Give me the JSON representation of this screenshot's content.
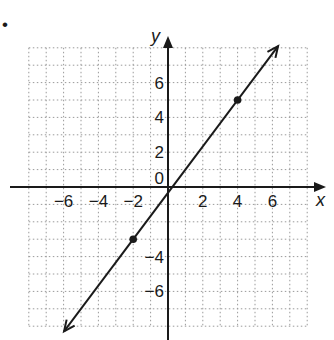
{
  "chart_data": {
    "type": "line",
    "title": "",
    "xlabel": "x",
    "ylabel": "y",
    "xlim": [
      -8,
      8
    ],
    "ylim": [
      -8,
      8
    ],
    "grid": true,
    "x_ticks": [
      -6,
      -4,
      -2,
      2,
      4,
      6
    ],
    "y_ticks": [
      6,
      4,
      2,
      0,
      -4,
      -6
    ],
    "x_tick_labels": [
      "−6",
      "−4",
      "−2",
      "2",
      "4",
      "6"
    ],
    "y_tick_labels": [
      "6",
      "4",
      "2",
      "0",
      "−4",
      "−6"
    ],
    "series": [
      {
        "name": "line",
        "x": [
          -2,
          4
        ],
        "y": [
          -3,
          5
        ],
        "style": "line with arrows at both ends",
        "marked_points": [
          [
            -2,
            -3
          ],
          [
            4,
            5
          ]
        ]
      }
    ],
    "bullet": "•"
  },
  "colors": {
    "ink": "#1a1a1a",
    "grid": "#9a9a9a",
    "background": "#ffffff"
  }
}
